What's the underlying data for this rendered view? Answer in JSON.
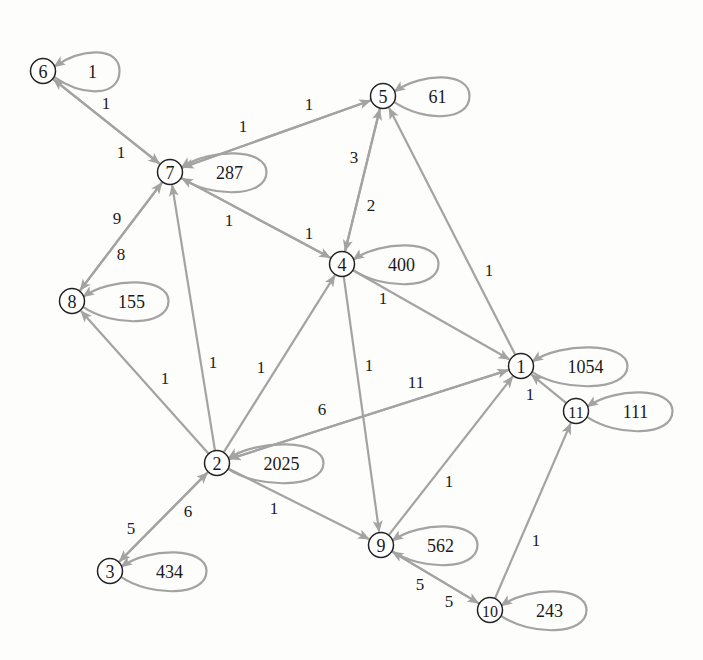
{
  "diagram": {
    "type": "directed-graph",
    "background": "#fdfdfc",
    "edge_color": "#a3a3a3",
    "node_stroke": "#222222",
    "nodes": [
      {
        "id": "1",
        "label": "1",
        "x": 521,
        "y": 366,
        "self_loop": "1054"
      },
      {
        "id": "2",
        "label": "2",
        "x": 217,
        "y": 463,
        "self_loop": "2025"
      },
      {
        "id": "3",
        "label": "3",
        "x": 110,
        "y": 571,
        "self_loop": "434"
      },
      {
        "id": "4",
        "label": "4",
        "x": 342,
        "y": 264,
        "self_loop": "400"
      },
      {
        "id": "5",
        "label": "5",
        "x": 383,
        "y": 96,
        "self_loop": "61"
      },
      {
        "id": "6",
        "label": "6",
        "x": 43,
        "y": 71,
        "self_loop": "1"
      },
      {
        "id": "7",
        "label": "7",
        "x": 170,
        "y": 172,
        "self_loop": "287"
      },
      {
        "id": "8",
        "label": "8",
        "x": 72,
        "y": 301,
        "self_loop": "155"
      },
      {
        "id": "9",
        "label": "9",
        "x": 381,
        "y": 545,
        "self_loop": "562"
      },
      {
        "id": "10",
        "label": "10",
        "x": 490,
        "y": 610,
        "self_loop": "243"
      },
      {
        "id": "11",
        "label": "11",
        "x": 576,
        "y": 411,
        "self_loop": "111"
      }
    ],
    "edges": [
      {
        "from": "7",
        "to": "6",
        "label": "1",
        "lx": 106,
        "ly": 103
      },
      {
        "from": "6",
        "to": "7",
        "label": "1",
        "lx": 121,
        "ly": 152
      },
      {
        "from": "5",
        "to": "7",
        "label": "1",
        "lx": 243,
        "ly": 126
      },
      {
        "from": "7",
        "to": "5",
        "label": "1",
        "lx": 309,
        "ly": 104
      },
      {
        "from": "4",
        "to": "5",
        "label": "3",
        "lx": 354,
        "ly": 157
      },
      {
        "from": "5",
        "to": "4",
        "label": "2",
        "lx": 371,
        "ly": 205
      },
      {
        "from": "4",
        "to": "7",
        "label": "1",
        "lx": 229,
        "ly": 220
      },
      {
        "from": "7",
        "to": "4",
        "label": "1",
        "lx": 309,
        "ly": 233
      },
      {
        "from": "8",
        "to": "7",
        "label": "9",
        "lx": 117,
        "ly": 218
      },
      {
        "from": "7",
        "to": "8",
        "label": "8",
        "lx": 121,
        "ly": 254
      },
      {
        "from": "4",
        "to": "1",
        "label": "1",
        "lx": 383,
        "ly": 298
      },
      {
        "from": "1",
        "to": "5",
        "label": "1",
        "lx": 489,
        "ly": 270
      },
      {
        "from": "4",
        "to": "9",
        "label": "1",
        "lx": 369,
        "ly": 365
      },
      {
        "from": "2",
        "to": "8",
        "label": "1",
        "lx": 165,
        "ly": 378
      },
      {
        "from": "2",
        "to": "7",
        "label": "1",
        "lx": 213,
        "ly": 362
      },
      {
        "from": "2",
        "to": "4",
        "label": "1",
        "lx": 261,
        "ly": 367
      },
      {
        "from": "1",
        "to": "2",
        "label": "6",
        "lx": 322,
        "ly": 409
      },
      {
        "from": "2",
        "to": "1",
        "label": "11",
        "lx": 416,
        "ly": 382
      },
      {
        "from": "2",
        "to": "9",
        "label": "1",
        "lx": 274,
        "ly": 508
      },
      {
        "from": "2",
        "to": "3",
        "label": "5",
        "lx": 131,
        "ly": 528
      },
      {
        "from": "3",
        "to": "2",
        "label": "6",
        "lx": 188,
        "ly": 511
      },
      {
        "from": "9",
        "to": "1",
        "label": "1",
        "lx": 449,
        "ly": 481
      },
      {
        "from": "10",
        "to": "9",
        "label": "5",
        "lx": 420,
        "ly": 584
      },
      {
        "from": "9",
        "to": "10",
        "label": "5",
        "lx": 449,
        "ly": 601
      },
      {
        "from": "10",
        "to": "11",
        "label": "1",
        "lx": 536,
        "ly": 540
      },
      {
        "from": "11",
        "to": "1",
        "label": "1",
        "lx": 530,
        "ly": 394
      }
    ]
  }
}
